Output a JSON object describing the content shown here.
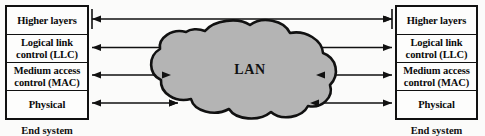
{
  "diagram": {
    "cloud": {
      "label": "LAN",
      "fill": "#b4b4b4",
      "stroke": "#111111"
    },
    "end_system_left": {
      "caption": "End system",
      "layers": [
        {
          "id": "higher-layers",
          "label": "Higher layers"
        },
        {
          "id": "llc",
          "line1": "Logical link",
          "line2": "control (LLC)"
        },
        {
          "id": "mac",
          "line1": "Medium access",
          "line2": "control (MAC)"
        },
        {
          "id": "physical",
          "label": "Physical"
        }
      ]
    },
    "end_system_right": {
      "caption": "End system",
      "layers": [
        {
          "id": "higher-layers",
          "label": "Higher layers"
        },
        {
          "id": "llc",
          "line1": "Logical link",
          "line2": "control (LLC)"
        },
        {
          "id": "mac",
          "line1": "Medium access",
          "line2": "control (MAC)"
        },
        {
          "id": "physical",
          "label": "Physical"
        }
      ]
    },
    "connections": [
      {
        "id": "higher-layers-link",
        "from": "higher-layers-left",
        "to": "higher-layers-right",
        "style": "double-headed",
        "spans_cloud": true
      },
      {
        "id": "llc-link",
        "from": "llc-left",
        "to": "llc-right",
        "style": "double-headed",
        "spans_cloud": true
      },
      {
        "id": "mac-link-left",
        "from": "mac-left",
        "to": "lan-cloud",
        "style": "double-headed"
      },
      {
        "id": "mac-link-right",
        "from": "lan-cloud",
        "to": "mac-right",
        "style": "double-headed"
      },
      {
        "id": "physical-link-left",
        "from": "physical-left",
        "to": "lan-cloud",
        "style": "double-headed"
      },
      {
        "id": "physical-link-right",
        "from": "lan-cloud",
        "to": "physical-right",
        "style": "double-headed"
      }
    ],
    "colors": {
      "line": "#111111",
      "box_border": "#111111",
      "background": "#fbfbfa",
      "cloud_fill": "#b4b4b4"
    }
  }
}
